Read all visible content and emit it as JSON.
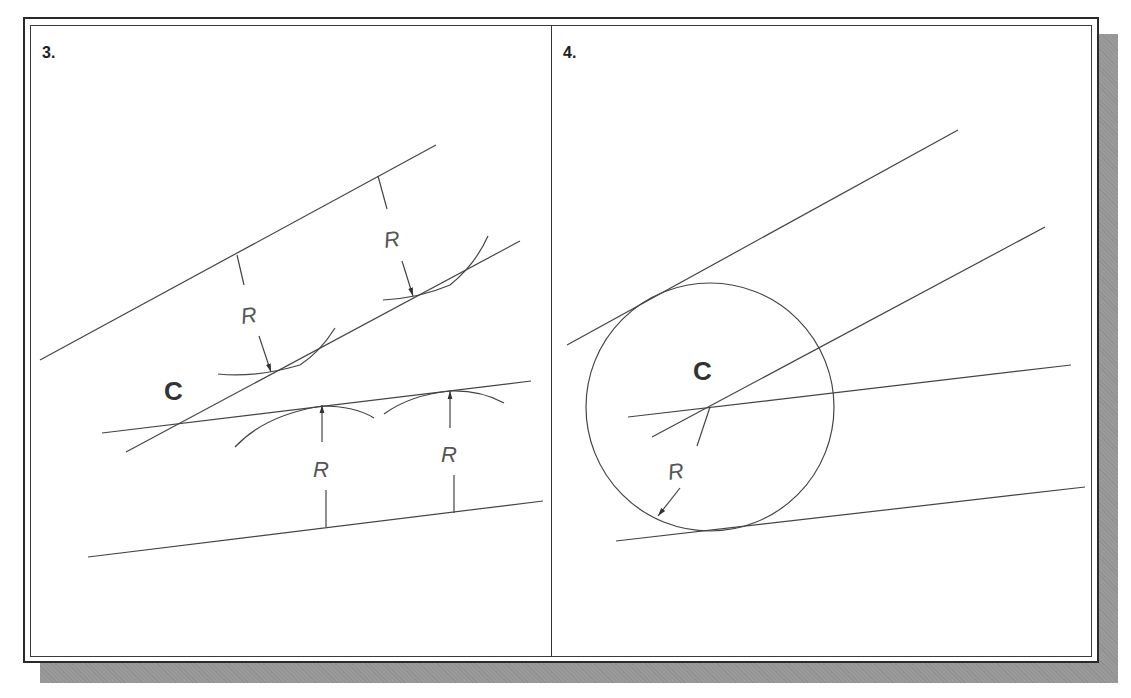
{
  "figure": {
    "panels": [
      {
        "label": "3.",
        "center_label": "C",
        "radius_labels": [
          "R",
          "R",
          "R",
          "R"
        ]
      },
      {
        "label": "4.",
        "center_label": "C",
        "radius_labels": [
          "R"
        ]
      }
    ],
    "colors": {
      "line": "#444444",
      "frame": "#2a2a2a",
      "shadow": "#9a9a9a",
      "background": "#ffffff"
    }
  }
}
